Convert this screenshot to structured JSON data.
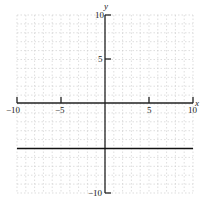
{
  "chart_data": {
    "type": "line",
    "title": "",
    "xlabel": "x",
    "ylabel": "y",
    "xlim": [
      -10,
      10
    ],
    "ylim": [
      -10,
      10
    ],
    "grid": true,
    "grid_step": 1,
    "x_ticks": [
      -10,
      -5,
      5,
      10
    ],
    "y_ticks": [
      10,
      5,
      -10
    ],
    "x_tick_labels": [
      "−10",
      "−5",
      "5",
      "10"
    ],
    "y_tick_labels": [
      "10",
      "5",
      "−10"
    ],
    "series": [
      {
        "name": "y = -5",
        "x": [
          -10,
          10
        ],
        "y": [
          -5,
          -5
        ]
      }
    ]
  },
  "labels": {
    "x_axis": "x",
    "y_axis": "y",
    "x_neg10": "−10",
    "x_neg5": "−5",
    "x_5": "5",
    "x_10": "10",
    "y_10": "10",
    "y_5": "5",
    "y_neg10": "−10"
  },
  "colors": {
    "axis": "#222222",
    "grid": "#c8c8c8",
    "line": "#111111"
  }
}
